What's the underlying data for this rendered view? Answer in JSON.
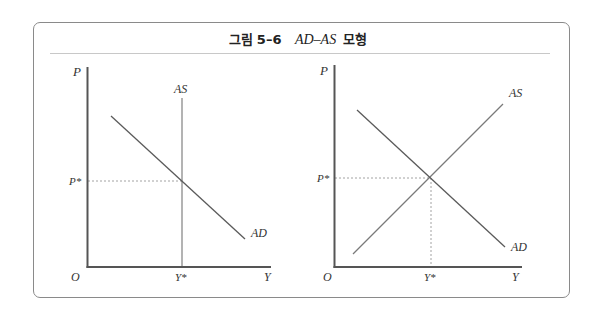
{
  "figure": {
    "title_prefix": "그림",
    "title_number": "5–6",
    "title_math": "AD–AS",
    "title_suffix": "모형"
  },
  "panels": [
    {
      "id": "left",
      "description": "Vertical AS (classical) with downward AD",
      "axis_labels": {
        "y": "P",
        "x": "Y",
        "origin": "O"
      },
      "curves": [
        {
          "name": "AS",
          "label": "AS",
          "shape": "vertical"
        },
        {
          "name": "AD",
          "label": "AD",
          "shape": "downward-sloping"
        }
      ],
      "equilibrium": {
        "price_label": "P*",
        "output_label": "Y*"
      }
    },
    {
      "id": "right",
      "description": "Upward AS with downward AD",
      "axis_labels": {
        "y": "P",
        "x": "Y",
        "origin": "O"
      },
      "curves": [
        {
          "name": "AS",
          "label": "AS",
          "shape": "upward-sloping"
        },
        {
          "name": "AD",
          "label": "AD",
          "shape": "downward-sloping"
        }
      ],
      "equilibrium": {
        "price_label": "P*",
        "output_label": "Y*"
      }
    }
  ],
  "colors": {
    "axis": "#555555",
    "curve": "#5a5a5a",
    "vertical_as": "#8a8a8a",
    "dashed": "#8a8a8a",
    "frame": "#8a8a8a",
    "divider": "#c8c8c8"
  }
}
